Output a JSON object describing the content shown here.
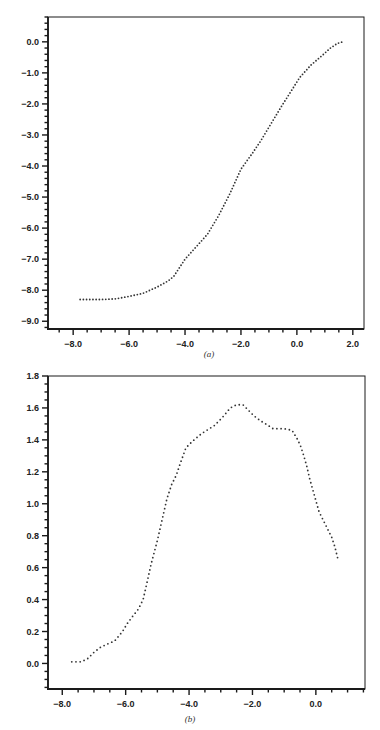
{
  "chart_data": [
    {
      "id": "a",
      "type": "scatter",
      "caption": "(a)",
      "title": "",
      "xlabel": "",
      "ylabel": "",
      "xlim": [
        -8.9,
        2.4
      ],
      "ylim": [
        -9.25,
        0.8
      ],
      "xticks": [
        -8.0,
        -6.0,
        -4.0,
        -2.0,
        0.0,
        2.0
      ],
      "xtick_labels": [
        "-8.0",
        "-6.0",
        "-4.0",
        "-2.0",
        "0.0",
        "2.0"
      ],
      "yticks": [
        0.0,
        -1.0,
        -2.0,
        -3.0,
        -4.0,
        -5.0,
        -6.0,
        -7.0,
        -8.0,
        -9.0
      ],
      "ytick_labels": [
        "0.0",
        "-1.0",
        "-2.0",
        "-3.0",
        "-4.0",
        "-5.0",
        "-6.0",
        "-7.0",
        "-8.0",
        "-9.0"
      ],
      "minor_ticks_per_major_x": 4,
      "minor_ticks_per_major_y": 5,
      "grid": false,
      "marker": "dotted",
      "series": [
        {
          "name": "curve-a",
          "x": [
            -7.75,
            -7.0,
            -6.5,
            -6.0,
            -5.5,
            -5.0,
            -4.6,
            -4.4,
            -4.0,
            -3.6,
            -3.2,
            -2.8,
            -2.4,
            -2.0,
            -1.6,
            -1.3,
            -0.9,
            -0.6,
            -0.25,
            0.1,
            0.5,
            0.93,
            1.2,
            1.45,
            1.65
          ],
          "y": [
            -8.3,
            -8.3,
            -8.28,
            -8.2,
            -8.1,
            -7.9,
            -7.7,
            -7.55,
            -7.0,
            -6.6,
            -6.2,
            -5.6,
            -4.9,
            -4.1,
            -3.6,
            -3.2,
            -2.6,
            -2.15,
            -1.65,
            -1.15,
            -0.75,
            -0.42,
            -0.2,
            -0.05,
            0.0
          ]
        }
      ]
    },
    {
      "id": "b",
      "type": "scatter",
      "caption": "(b)",
      "title": "",
      "xlabel": "",
      "ylabel": "",
      "xlim": [
        -8.45,
        1.55
      ],
      "ylim": [
        -0.16,
        1.8
      ],
      "xticks": [
        -8.0,
        -6.0,
        -4.0,
        -2.0,
        0.0
      ],
      "xtick_labels": [
        "-8.0",
        "-6.0",
        "-4.0",
        "-2.0",
        "0.0"
      ],
      "yticks": [
        1.8,
        1.6,
        1.4,
        1.2,
        1.0,
        0.8,
        0.6,
        0.4,
        0.2,
        0.0
      ],
      "ytick_labels": [
        "1.8",
        "1.6",
        "1.4",
        "1.2",
        "1.0",
        "0.8",
        "0.6",
        "0.4",
        "0.2",
        "0.0"
      ],
      "minor_ticks_per_major_x": 4,
      "minor_ticks_per_major_y": 4,
      "grid": false,
      "marker": "dotted",
      "series": [
        {
          "name": "curve-b",
          "x": [
            -7.7,
            -7.4,
            -7.2,
            -7.0,
            -6.8,
            -6.6,
            -6.35,
            -6.1,
            -5.95,
            -5.8,
            -5.6,
            -5.45,
            -5.3,
            -5.2,
            -5.0,
            -4.85,
            -4.7,
            -4.55,
            -4.4,
            -4.3,
            -4.1,
            -3.9,
            -3.6,
            -3.2,
            -2.95,
            -2.7,
            -2.5,
            -2.3,
            -2.15,
            -1.95,
            -1.75,
            -1.5,
            -1.35,
            -1.0,
            -0.75,
            -0.57,
            -0.48,
            -0.38,
            -0.28,
            -0.2,
            -0.1,
            0.0,
            0.1,
            0.2,
            0.3,
            0.4,
            0.5,
            0.6,
            0.7
          ],
          "y": [
            0.01,
            0.01,
            0.03,
            0.07,
            0.1,
            0.12,
            0.14,
            0.2,
            0.25,
            0.29,
            0.34,
            0.4,
            0.53,
            0.62,
            0.77,
            0.9,
            1.03,
            1.12,
            1.18,
            1.24,
            1.35,
            1.39,
            1.44,
            1.49,
            1.54,
            1.6,
            1.62,
            1.62,
            1.59,
            1.55,
            1.52,
            1.49,
            1.47,
            1.47,
            1.46,
            1.4,
            1.36,
            1.3,
            1.23,
            1.16,
            1.09,
            1.02,
            0.95,
            0.91,
            0.87,
            0.83,
            0.79,
            0.73,
            0.65
          ]
        }
      ]
    }
  ],
  "colors": {
    "axis": "#1a1a1a",
    "dots": "#333333",
    "background": "#ffffff"
  }
}
